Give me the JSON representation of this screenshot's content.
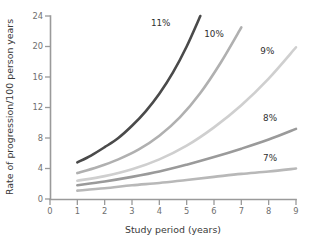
{
  "chart_data": {
    "type": "line",
    "title": "",
    "subtitle": "",
    "xlabel": "Study period (years)",
    "ylabel": "Rate of progression/100 person years",
    "xlim": [
      0,
      9
    ],
    "ylim": [
      0,
      24
    ],
    "xticks": [
      0,
      1,
      2,
      3,
      4,
      5,
      6,
      7,
      8,
      9
    ],
    "xtick_labels": [
      "0",
      "1",
      "2",
      "3",
      "4",
      "5",
      "6",
      "7",
      "8",
      "9"
    ],
    "yticks": [
      0,
      4,
      8,
      12,
      16,
      20,
      24
    ],
    "ytick_labels": [
      "0",
      "4",
      "8",
      "12",
      "16",
      "20",
      "24"
    ],
    "grid": false,
    "legend_position": "inline-curve-labels",
    "series": [
      {
        "name": "11%",
        "label": "11%",
        "color": "#4a4a4a",
        "stroke_width": 2.6,
        "label_x": 4.05,
        "label_y": 23.0,
        "x": [
          1,
          1.5,
          2,
          2.5,
          3,
          3.5,
          4,
          4.5,
          5,
          5.5
        ],
        "y": [
          4.8,
          5.7,
          6.8,
          8.0,
          9.6,
          11.5,
          13.8,
          16.6,
          20.0,
          24.0
        ]
      },
      {
        "name": "10%",
        "label": "10%",
        "color": "#b0b0b0",
        "stroke_width": 2.6,
        "label_x": 6.0,
        "label_y": 21.6,
        "x": [
          1,
          1.75,
          2.5,
          3.25,
          4,
          4.75,
          5.5,
          6.25,
          7
        ],
        "y": [
          3.4,
          4.2,
          5.2,
          6.5,
          8.3,
          10.7,
          13.9,
          17.9,
          22.5
        ]
      },
      {
        "name": "9%",
        "label": "9%",
        "color": "#cfcfcf",
        "stroke_width": 2.6,
        "label_x": 7.95,
        "label_y": 19.4,
        "x": [
          1,
          2,
          3,
          4,
          5,
          6,
          7,
          8,
          9
        ],
        "y": [
          2.4,
          3.0,
          3.9,
          5.2,
          7.0,
          9.4,
          12.3,
          15.8,
          19.9
        ]
      },
      {
        "name": "8%",
        "label": "8%",
        "color": "#9a9a9a",
        "stroke_width": 2.6,
        "label_x": 8.05,
        "label_y": 10.6,
        "x": [
          1,
          2,
          3,
          4,
          5,
          6,
          7,
          8,
          9
        ],
        "y": [
          1.8,
          2.3,
          2.9,
          3.6,
          4.5,
          5.5,
          6.6,
          7.8,
          9.2
        ]
      },
      {
        "name": "7%",
        "label": "7%",
        "color": "#b8b8b8",
        "stroke_width": 2.6,
        "label_x": 8.05,
        "label_y": 5.3,
        "x": [
          1,
          2,
          3,
          4,
          5,
          6,
          7,
          8,
          9
        ],
        "y": [
          1.1,
          1.4,
          1.8,
          2.1,
          2.5,
          2.9,
          3.3,
          3.6,
          4.0
        ]
      }
    ]
  },
  "axes": {
    "x_title": "Study period (years)",
    "y_title": "Rate of progression/100 person years"
  },
  "colors": {
    "axis": "#9a9a9a",
    "tick_text": "#6f6f6f",
    "title_text": "#3a3a3a",
    "background": "#ffffff"
  }
}
